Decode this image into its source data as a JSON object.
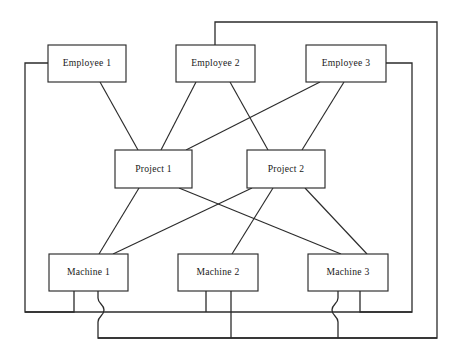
{
  "diagram": {
    "canvas": {
      "width": 457,
      "height": 356
    },
    "style": {
      "background_color": "#ffffff",
      "line_color": "#2b2b2b",
      "node_fill": "#ffffff",
      "node_stroke": "#2b2b2b",
      "text_color": "#1a1a1a"
    },
    "nodes": [
      {
        "id": "employee1",
        "label": "Employee 1",
        "row": "employee",
        "x": 48,
        "y": 45,
        "w": 78,
        "h": 37
      },
      {
        "id": "employee2",
        "label": "Employee 2",
        "row": "employee",
        "x": 176,
        "y": 45,
        "w": 79,
        "h": 37
      },
      {
        "id": "employee3",
        "label": "Employee 3",
        "row": "employee",
        "x": 306,
        "y": 45,
        "w": 80,
        "h": 37
      },
      {
        "id": "project1",
        "label": "Project 1",
        "row": "project",
        "x": 115,
        "y": 150,
        "w": 77,
        "h": 38
      },
      {
        "id": "project2",
        "label": "Project 2",
        "row": "project",
        "x": 247,
        "y": 150,
        "w": 78,
        "h": 38
      },
      {
        "id": "machine1",
        "label": "Machine 1",
        "row": "machine",
        "x": 49,
        "y": 254,
        "w": 79,
        "h": 37
      },
      {
        "id": "machine2",
        "label": "Machine 2",
        "row": "machine",
        "x": 178,
        "y": 254,
        "w": 80,
        "h": 37
      },
      {
        "id": "machine3",
        "label": "Machine 3",
        "row": "machine",
        "x": 308,
        "y": 254,
        "w": 80,
        "h": 37
      }
    ],
    "diagonal_edges": [
      {
        "id": "e1-p1",
        "from": "employee1",
        "to": "project1",
        "x1": 100,
        "y1": 82,
        "x2": 138,
        "y2": 150
      },
      {
        "id": "e2-p1",
        "from": "employee2",
        "to": "project1",
        "x1": 196,
        "y1": 82,
        "x2": 161,
        "y2": 150
      },
      {
        "id": "e2-p2",
        "from": "employee2",
        "to": "project2",
        "x1": 230,
        "y1": 82,
        "x2": 268,
        "y2": 150
      },
      {
        "id": "e3-p1",
        "from": "employee3",
        "to": "project1",
        "x1": 320,
        "y1": 82,
        "x2": 186,
        "y2": 150
      },
      {
        "id": "e3-p2",
        "from": "employee3",
        "to": "project2",
        "x1": 344,
        "y1": 82,
        "x2": 302,
        "y2": 150
      },
      {
        "id": "p1-m1",
        "from": "project1",
        "to": "machine1",
        "x1": 139,
        "y1": 188,
        "x2": 99,
        "y2": 254
      },
      {
        "id": "p1-m3",
        "from": "project1",
        "to": "machine3",
        "x1": 179,
        "y1": 188,
        "x2": 341,
        "y2": 254
      },
      {
        "id": "p2-m1",
        "from": "project2",
        "to": "machine1",
        "x1": 252,
        "y1": 188,
        "x2": 113,
        "y2": 254
      },
      {
        "id": "p2-m2",
        "from": "project2",
        "to": "machine2",
        "x1": 273,
        "y1": 188,
        "x2": 232,
        "y2": 254
      },
      {
        "id": "p2-m3",
        "from": "project2",
        "to": "machine3",
        "x1": 305,
        "y1": 188,
        "x2": 367,
        "y2": 254
      }
    ],
    "routed_edges": [
      {
        "id": "e1-m1-left-loop",
        "from": "employee1",
        "to": "machine1",
        "description": "Employee 1 left side, down the left margin, across the bottom bus to Machine 1",
        "path": "M 48 63 L 25 63 L 25 312 L 74 312 L 74 291"
      },
      {
        "id": "e2-m1-outer-loop",
        "from": "employee2",
        "to": "machine1",
        "description": "Employee 2 top, up and around the outer right margin to the lowest bus, back to Machine 1",
        "path": "M 215 45 L 215 22 L 437 22 L 437 338 L 98 338 L 98 322 C 98 316 104 316 104 310 C 104 304 98 304 98 298 L 98 291"
      },
      {
        "id": "e3-m3-right-loop",
        "from": "employee3",
        "to": "machine3",
        "description": "Employee 3 right side, down the inner right margin to the bus, back to Machine 3",
        "path": "M 386 63 L 412 63 L 412 312 L 360 312 L 360 291"
      },
      {
        "id": "m2-bus-left",
        "from": "machine2",
        "to": "bus-left",
        "description": "Machine 2 bottom-left stub joining the upper horizontal bus",
        "path": "M 206 291 L 206 312"
      },
      {
        "id": "m2-bus-right",
        "from": "machine2",
        "to": "bus-lower",
        "description": "Machine 2 bottom-right stub dropping to the lower horizontal bus",
        "path": "M 231 291 L 231 338"
      },
      {
        "id": "m3-bus-lower",
        "from": "machine3",
        "to": "bus-lower",
        "description": "Machine 3 bottom-left stub hopping over the upper bus and down to the lower bus",
        "path": "M 338 291 L 338 298 C 338 304 332 304 332 310 C 332 316 338 316 338 322 L 338 338"
      },
      {
        "id": "bus-upper",
        "from": "bus",
        "to": "bus",
        "description": "Upper horizontal routing bus",
        "path": "M 25 312 L 412 312"
      },
      {
        "id": "bus-lower",
        "from": "bus",
        "to": "bus",
        "description": "Lower horizontal routing bus",
        "path": "M 98 338 L 437 338"
      }
    ]
  }
}
